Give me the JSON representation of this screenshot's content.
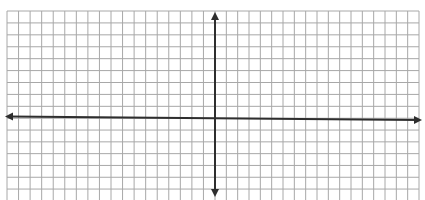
{
  "diagram": {
    "type": "coordinate-plane",
    "colors": {
      "background": "#ffffff",
      "grid_line": "#a8a8a8",
      "axis": "#2e2e2e"
    },
    "grid": {
      "left": 7,
      "top": 11,
      "right": 419,
      "bottom": 200,
      "cell_width": 11.55,
      "cell_height": 11.8,
      "columns_left_of_y_axis": 18,
      "columns_right_of_y_axis": 18,
      "rows_above_x_axis": 9,
      "rows_below_x_axis": 7
    },
    "x_axis": {
      "label": "",
      "start": {
        "x": 5,
        "y": 116.5
      },
      "end": {
        "x": 422,
        "y": 120
      },
      "arrows": "both"
    },
    "y_axis": {
      "label": "",
      "start": {
        "x": 215,
        "y": 12
      },
      "end": {
        "x": 215,
        "y": 197
      },
      "arrows": "both"
    }
  }
}
